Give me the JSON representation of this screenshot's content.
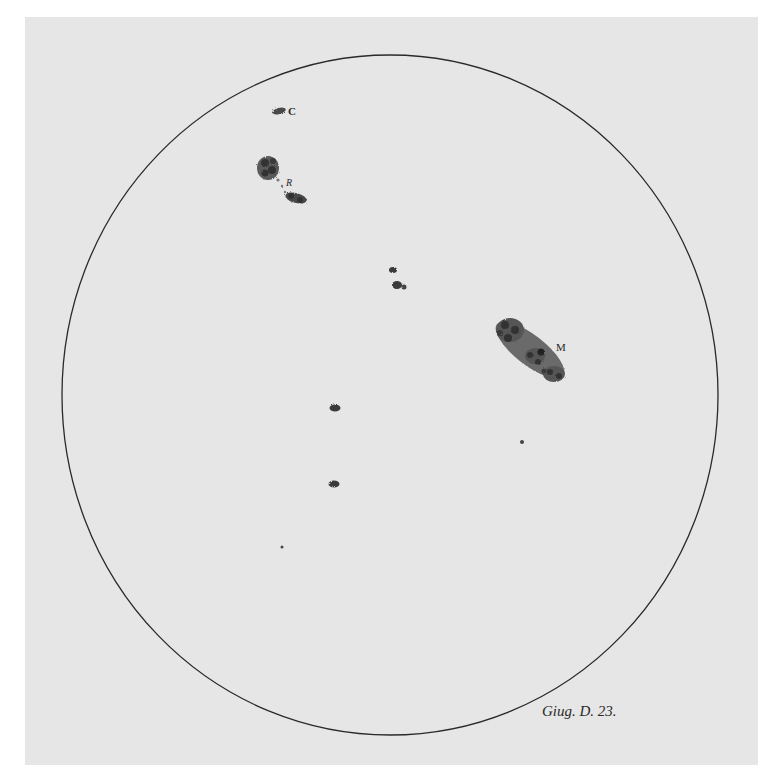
{
  "figure": {
    "caption": "Giug. D. 23.",
    "colors": {
      "page": "#ffffff",
      "plate": "#e6e6e6",
      "ink": "#2a2a2a",
      "spot": "#555555"
    },
    "disk": {
      "cx": 390,
      "cy": 395,
      "rx": 328,
      "ry": 340
    },
    "labels": [
      {
        "id": "C",
        "text": "C",
        "x": 288,
        "y": 115
      },
      {
        "id": "R",
        "text": "R",
        "x": 287,
        "y": 186
      },
      {
        "id": "M",
        "text": "M",
        "x": 556,
        "y": 351
      }
    ],
    "spots": [
      {
        "name": "spot-group-c",
        "desc": "small elongated spot near label C"
      },
      {
        "name": "spot-group-r",
        "desc": "cluster of spots near label R"
      },
      {
        "name": "spot-pair-center",
        "desc": "two small spots near center"
      },
      {
        "name": "spot-group-m",
        "desc": "large elongated spot group near label M"
      },
      {
        "name": "spot-lower-1",
        "desc": "small spot below center"
      },
      {
        "name": "spot-lower-2",
        "desc": "small spot further below"
      },
      {
        "name": "dot-lower-left",
        "desc": "tiny dot lower left"
      },
      {
        "name": "dot-right",
        "desc": "tiny dot below M group"
      }
    ]
  }
}
